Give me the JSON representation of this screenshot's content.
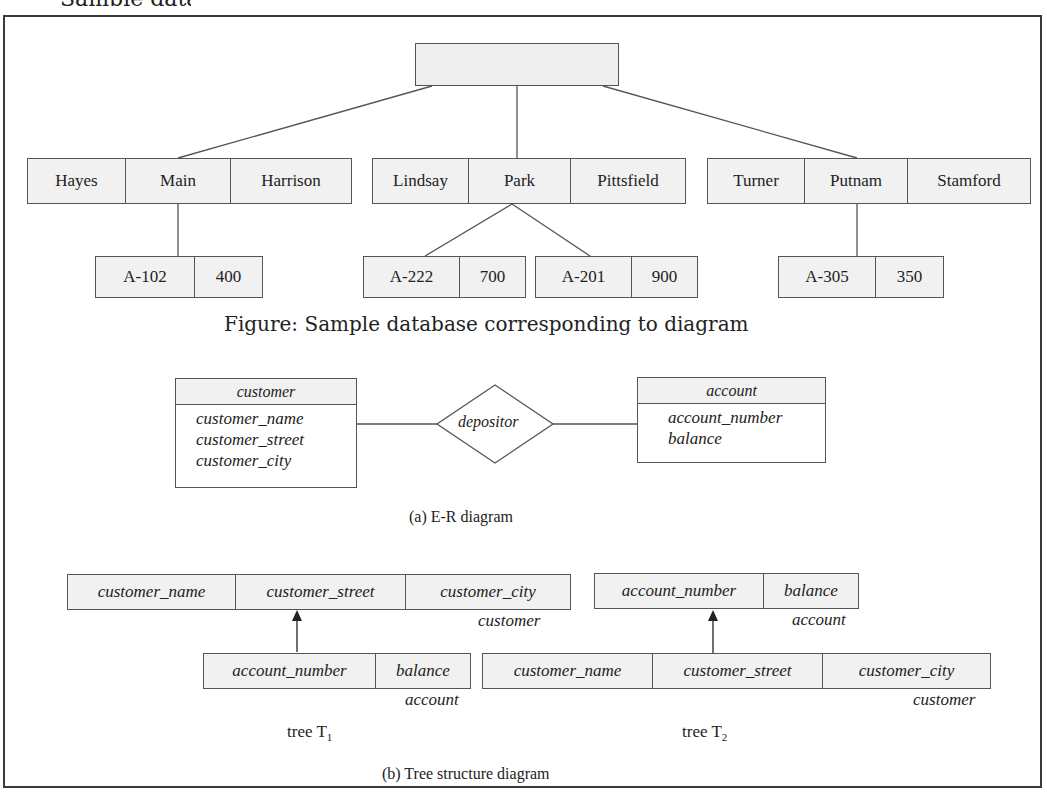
{
  "header": {
    "partial_title": "Sample database"
  },
  "sample_database": {
    "root_record": {
      "label": ""
    },
    "customers": [
      {
        "fields": [
          "Hayes",
          "Main",
          "Harrison"
        ],
        "accounts": [
          {
            "fields": [
              "A-102",
              "400"
            ]
          }
        ]
      },
      {
        "fields": [
          "Lindsay",
          "Park",
          "Pittsfield"
        ],
        "accounts": [
          {
            "fields": [
              "A-222",
              "700"
            ]
          },
          {
            "fields": [
              "A-201",
              "900"
            ]
          }
        ]
      },
      {
        "fields": [
          "Turner",
          "Putnam",
          "Stamford"
        ],
        "accounts": [
          {
            "fields": [
              "A-305",
              "350"
            ]
          }
        ]
      }
    ],
    "caption": "Figure: Sample database corresponding to diagram"
  },
  "er_diagram": {
    "entities": [
      {
        "name": "customer",
        "attributes": [
          "customer_name",
          "customer_street",
          "customer_city"
        ]
      },
      {
        "name": "account",
        "attributes": [
          "account_number",
          "balance"
        ]
      }
    ],
    "relationship": {
      "name": "depositor"
    },
    "caption": "(a) E-R diagram"
  },
  "tree_structure": {
    "trees": [
      {
        "label_main": "tree T",
        "label_sub": "1",
        "parent": {
          "record_type": "customer",
          "fields": [
            "customer_name",
            "customer_street",
            "customer_city"
          ]
        },
        "child": {
          "record_type": "account",
          "fields": [
            "account_number",
            "balance"
          ]
        }
      },
      {
        "label_main": "tree T",
        "label_sub": "2",
        "parent": {
          "record_type": "account",
          "fields": [
            "account_number",
            "balance"
          ]
        },
        "child": {
          "record_type": "customer",
          "fields": [
            "customer_name",
            "customer_street",
            "customer_city"
          ]
        }
      }
    ],
    "caption": "(b) Tree structure diagram"
  },
  "colors": {
    "record_fill": "#f1f1f1",
    "border": "#555555",
    "text": "#222222",
    "background": "#ffffff"
  }
}
